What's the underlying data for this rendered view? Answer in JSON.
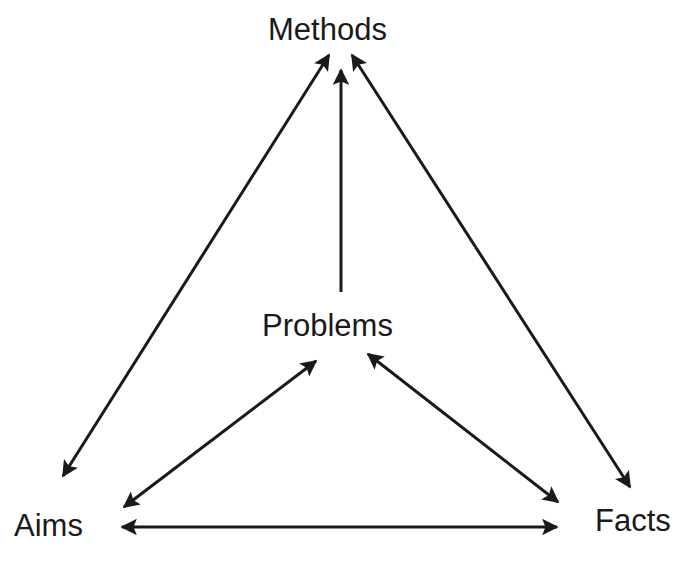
{
  "diagram": {
    "type": "concept-triangle",
    "nodes": {
      "methods": "Methods",
      "problems": "Problems",
      "aims": "Aims",
      "facts": "Facts"
    },
    "edges": [
      {
        "from": "Aims",
        "to": "Methods",
        "direction": "bidirectional"
      },
      {
        "from": "Problems",
        "to": "Methods",
        "direction": "one-way"
      },
      {
        "from": "Facts",
        "to": "Methods",
        "direction": "bidirectional"
      },
      {
        "from": "Aims",
        "to": "Problems",
        "direction": "bidirectional"
      },
      {
        "from": "Problems",
        "to": "Facts",
        "direction": "bidirectional"
      },
      {
        "from": "Aims",
        "to": "Facts",
        "direction": "bidirectional"
      }
    ],
    "colors": {
      "background": "#ffffff",
      "ink": "#1a1a1a"
    }
  }
}
